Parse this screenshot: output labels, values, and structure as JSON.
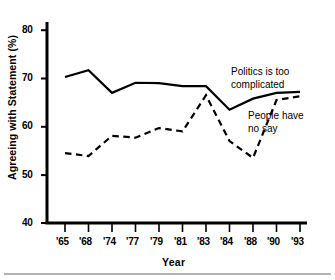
{
  "chart_data": {
    "type": "line",
    "title": "",
    "xlabel": "Year",
    "ylabel": "Agreeing with Statement (%)",
    "categories": [
      "'65",
      "'68",
      "'74",
      "'77",
      "'79",
      "'81",
      "'83",
      "'84",
      "'88",
      "'90",
      "'93"
    ],
    "ylim": [
      40,
      80
    ],
    "yticks": [
      40,
      50,
      60,
      70,
      80
    ],
    "ytick_labels": [
      "40",
      "50",
      "60",
      "70",
      "80"
    ],
    "grid": false,
    "legend_position": "inline-annotations",
    "series": [
      {
        "name": "Politics is too complicated",
        "style": "solid",
        "color": "#000000",
        "values": [
          70.3,
          71.7,
          67.0,
          69.1,
          69.0,
          68.4,
          68.4,
          63.5,
          65.8,
          67.0,
          67.2
        ]
      },
      {
        "name": "People have no say",
        "style": "dashed",
        "color": "#000000",
        "values": [
          54.5,
          53.9,
          58.1,
          57.7,
          59.7,
          59.0,
          66.5,
          57.0,
          53.5,
          65.5,
          66.3
        ]
      }
    ],
    "annotations": [
      {
        "id": "politics",
        "line1": "Politics is too",
        "line2": "complicated"
      },
      {
        "id": "people",
        "line1": "People have",
        "line2": "no say"
      }
    ]
  },
  "axis": {
    "y_title": "Agreeing with Statement (%)",
    "x_title": "Year"
  }
}
